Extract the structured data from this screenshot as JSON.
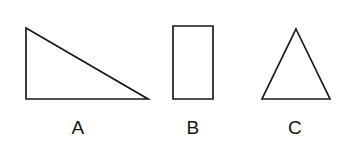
{
  "figure": {
    "background_color": "#ffffff",
    "stroke_color": "#1a1a1a",
    "label_color": "#141414",
    "width": 351,
    "height": 153,
    "shapes": [
      {
        "id": "shape-a",
        "label": "A",
        "type": "right-triangle",
        "points": "26,28 26,99 148,99",
        "label_x": 78,
        "label_y": 127
      },
      {
        "id": "shape-b",
        "label": "B",
        "type": "rectangle",
        "points": "173,26 213,26 213,99 173,99",
        "label_x": 193,
        "label_y": 127
      },
      {
        "id": "shape-c",
        "label": "C",
        "type": "isosceles-triangle",
        "points": "296,29 330,99 262,99",
        "label_x": 295,
        "label_y": 127
      }
    ]
  },
  "chart_data": {
    "type": "diagram",
    "title": "",
    "items": [
      {
        "label": "A",
        "shape": "right triangle",
        "vertices": [
          [
            26,
            28
          ],
          [
            26,
            99
          ],
          [
            148,
            99
          ]
        ],
        "width": 122,
        "height": 71
      },
      {
        "label": "B",
        "shape": "rectangle",
        "vertices": [
          [
            173,
            26
          ],
          [
            213,
            26
          ],
          [
            213,
            99
          ],
          [
            173,
            99
          ]
        ],
        "width": 40,
        "height": 73
      },
      {
        "label": "C",
        "shape": "isosceles triangle",
        "vertices": [
          [
            296,
            29
          ],
          [
            330,
            99
          ],
          [
            262,
            99
          ]
        ],
        "width": 68,
        "height": 70
      }
    ]
  }
}
